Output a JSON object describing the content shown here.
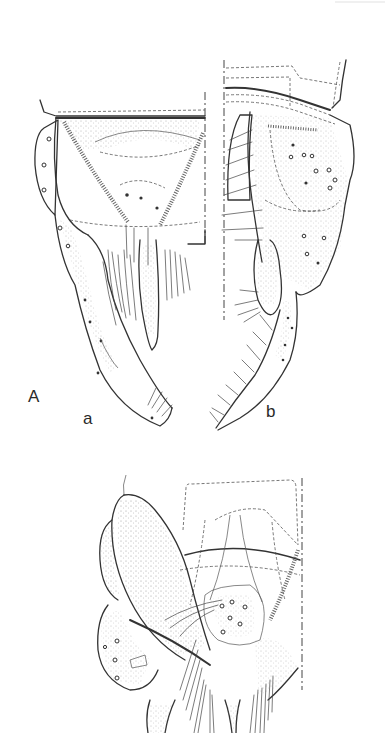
{
  "figure": {
    "panel_label": "A",
    "subfigures": [
      {
        "id": "a",
        "label": "a",
        "view": "dorsal/ventral split view, upper left"
      },
      {
        "id": "b",
        "label": "b",
        "view": "lateral view, upper right"
      },
      {
        "id": "c",
        "label": "",
        "view": "lower figure, unlabeled"
      }
    ]
  },
  "labels": {
    "panel": "A",
    "sub_a": "a",
    "sub_b": "b"
  },
  "colors": {
    "background": "#ffffff",
    "ink": "#333333"
  }
}
